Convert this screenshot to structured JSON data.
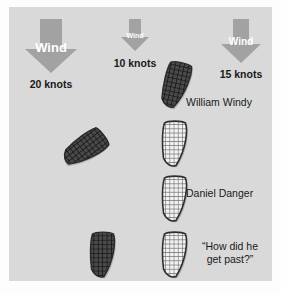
{
  "canvas": {
    "width": 281,
    "height": 294,
    "background": "#ffffff",
    "panel_color": "#d9d9d9"
  },
  "colors": {
    "arrow": "#a2a2a2",
    "arrow_text": "#ffffff",
    "label_text": "#1a1a1a",
    "boat_dark_fill": "#4a4a4a",
    "boat_dark_grid": "#1e1e1e",
    "boat_light_fill": "#f0f0f0",
    "boat_light_grid": "#5a5a5a",
    "boat_outline": "#3a3a3a",
    "boat_shadow": "#b5b5b5"
  },
  "wind_indicators": [
    {
      "id": "wind-left",
      "label": "Wind",
      "speed_label": "20 knots",
      "size": "large",
      "arrow_width": 52,
      "arrow_height": 54,
      "wind_font_size": 13,
      "knots_font_size": 10.5,
      "x": 16,
      "y": 12,
      "knots_x": 9,
      "knots_y": 72
    },
    {
      "id": "wind-center",
      "label": "Wind",
      "speed_label": "10 knots",
      "size": "small",
      "arrow_width": 28,
      "arrow_height": 32,
      "wind_font_size": 7,
      "knots_font_size": 10.5,
      "x": 112,
      "y": 12,
      "knots_x": 96,
      "knots_y": 51
    },
    {
      "id": "wind-right",
      "label": "Wind",
      "speed_label": "15 knots",
      "size": "medium",
      "arrow_width": 40,
      "arrow_height": 44,
      "wind_font_size": 10,
      "knots_font_size": 10.5,
      "x": 212,
      "y": 12,
      "knots_x": 196,
      "knots_y": 62
    }
  ],
  "boats": [
    {
      "id": "boat-william-windy",
      "style": "dark",
      "x": 153,
      "y": 54,
      "width": 29,
      "height": 48,
      "rotation": 12
    },
    {
      "id": "boat-rogue-dark",
      "style": "dark",
      "x": 62,
      "y": 118,
      "width": 29,
      "height": 48,
      "rotation": 52
    },
    {
      "id": "boat-light-upper",
      "style": "light",
      "x": 152,
      "y": 113,
      "width": 28,
      "height": 47,
      "rotation": 0
    },
    {
      "id": "boat-daniel-danger",
      "style": "light",
      "x": 152,
      "y": 168,
      "width": 28,
      "height": 47,
      "rotation": 0
    },
    {
      "id": "boat-light-lower",
      "style": "light",
      "x": 152,
      "y": 224,
      "width": 28,
      "height": 47,
      "rotation": 0
    },
    {
      "id": "boat-dark-lower-left",
      "style": "dark",
      "x": 80,
      "y": 224,
      "width": 28,
      "height": 47,
      "rotation": 0
    }
  ],
  "labels": [
    {
      "id": "label-william-windy",
      "text": "William Windy",
      "x": 187,
      "y": 89
    },
    {
      "id": "label-daniel-danger",
      "text": "Daniel Danger",
      "x": 187,
      "y": 180
    }
  ],
  "quote": {
    "id": "label-quote",
    "text": "“How did he\nget past?”",
    "x": 187,
    "y": 233,
    "width": 80
  }
}
